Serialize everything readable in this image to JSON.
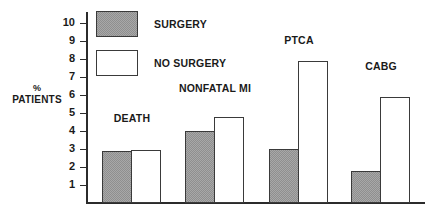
{
  "chart_data": {
    "type": "bar",
    "title": "",
    "xlabel": "",
    "ylabel": "% PATIENTS",
    "ylabel_line1": "%",
    "ylabel_line2": "PATIENTS",
    "ylim": [
      0,
      10
    ],
    "ytick_labels": [
      "10",
      "9",
      "8",
      "7",
      "6",
      "5",
      "4",
      "3",
      "2",
      "1"
    ],
    "yticks": [
      10,
      9,
      8,
      7,
      6,
      5,
      4,
      3,
      2,
      1
    ],
    "grid": false,
    "legend_position": "top-left",
    "categories": [
      "DEATH",
      "NONFATAL MI",
      "PTCA",
      "CABG"
    ],
    "series": [
      {
        "name": "SURGERY",
        "fill": "hatched-gray",
        "color": "#a8a8a8",
        "values": [
          2.9,
          4.0,
          3.0,
          1.8
        ]
      },
      {
        "name": "NO SURGERY",
        "fill": "white",
        "color": "#ffffff",
        "values": [
          2.95,
          4.8,
          7.9,
          5.9
        ]
      }
    ]
  },
  "legend": {
    "items": [
      {
        "label": "SURGERY",
        "swatch": "filled"
      },
      {
        "label": "NO SURGERY",
        "swatch": "empty"
      }
    ]
  },
  "axis": {
    "y_title_line1": "%",
    "y_title_line2": "PATIENTS",
    "ticks": [
      "10",
      "9",
      "8",
      "7",
      "6",
      "5",
      "4",
      "3",
      "2",
      "1"
    ]
  },
  "groups": [
    {
      "label": "DEATH",
      "surgery": 2.9,
      "no_surgery": 2.95
    },
    {
      "label": "NONFATAL MI",
      "surgery": 4.0,
      "no_surgery": 4.8
    },
    {
      "label": "PTCA",
      "surgery": 3.0,
      "no_surgery": 7.9
    },
    {
      "label": "CABG",
      "surgery": 1.8,
      "no_surgery": 5.9
    }
  ],
  "colors": {
    "bar_fill_surgery": "#a8a8a8",
    "bar_fill_no_surgery": "#ffffff",
    "bar_border": "#3a3a3a",
    "axis": "#2b2b2b",
    "text": "#1a1a1a",
    "background": "#ffffff"
  }
}
